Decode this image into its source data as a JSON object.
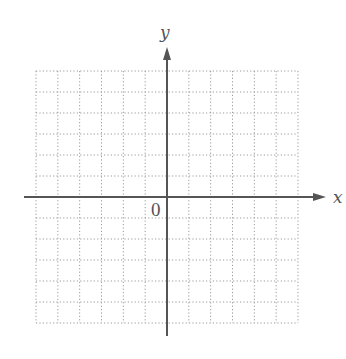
{
  "diagram": {
    "type": "coordinate-plane",
    "grid": {
      "left": 36,
      "top": 71,
      "right": 298,
      "bottom": 323,
      "columns": 12,
      "rows": 12,
      "style": "dotted",
      "color": "#9a9a9a"
    },
    "x_axis": {
      "label": "x",
      "y": 197,
      "start_x": 24,
      "end_x": 326,
      "arrow": "right",
      "color": "#555555"
    },
    "y_axis": {
      "label": "y",
      "x": 167,
      "start_y": 336,
      "end_y": 47,
      "arrow": "up",
      "color": "#555555"
    },
    "origin": {
      "label": "0"
    }
  }
}
